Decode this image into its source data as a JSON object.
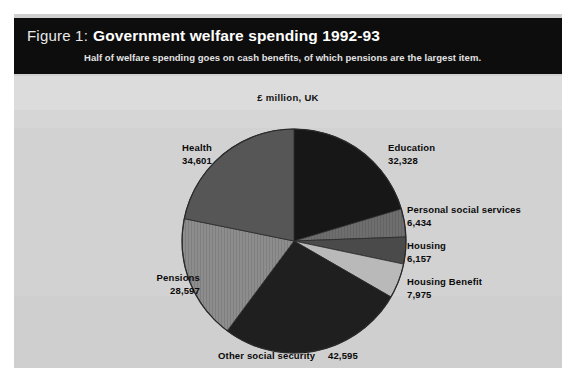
{
  "figure": {
    "number": "Figure 1:",
    "title": "Government welfare spending 1992-93",
    "subtitle": "Half of welfare spending goes on cash benefits, of which pensions are the largest item.",
    "units": "£ million, UK"
  },
  "chart_data": {
    "type": "pie",
    "title": "Government welfare spending 1992-93",
    "subtitle": "Half of welfare spending goes on cash benefits, of which pensions are the largest item.",
    "units": "£ million, UK",
    "xlabel": "",
    "ylabel": "",
    "legend_position": "callout-labels",
    "grid": false,
    "total": 158687,
    "categories": [
      "Education",
      "Personal social services",
      "Housing",
      "Housing Benefit",
      "Other social security",
      "Pensions",
      "Health"
    ],
    "values": [
      32328,
      6434,
      6157,
      7975,
      42595,
      28597,
      34601
    ],
    "value_labels": [
      "32,328",
      "6,434",
      "6,157",
      "7,975",
      "42,595",
      "28,597",
      "34,601"
    ],
    "colors": [
      "#171717",
      "#6e6e6e",
      "#4a4a4a",
      "#b9b9b9",
      "#1f1f1f",
      "#8d8d8d",
      "#565656"
    ],
    "slices": [
      {
        "label": "Education",
        "value": 32328,
        "value_text": "32,328",
        "color": "#171717",
        "start_angle": 0.0,
        "end_angle": 73.3
      },
      {
        "label": "Personal social services",
        "value": 6434,
        "value_text": "6,434",
        "color": "#6e6e6e",
        "start_angle": 73.3,
        "end_angle": 87.9
      },
      {
        "label": "Housing",
        "value": 6157,
        "value_text": "6,157",
        "color": "#4a4a4a",
        "start_angle": 87.9,
        "end_angle": 101.9
      },
      {
        "label": "Housing Benefit",
        "value": 7975,
        "value_text": "7,975",
        "color": "#b9b9b9",
        "start_angle": 101.9,
        "end_angle": 120.0
      },
      {
        "label": "Other social security",
        "value": 42595,
        "value_text": "42,595",
        "color": "#1f1f1f",
        "start_angle": 120.0,
        "end_angle": 216.6
      },
      {
        "label": "Pensions",
        "value": 28597,
        "value_text": "28,597",
        "color": "#8d8d8d",
        "start_angle": 216.6,
        "end_angle": 281.5
      },
      {
        "label": "Health",
        "value": 34601,
        "value_text": "34,601",
        "color": "#565656",
        "start_angle": 281.5,
        "end_angle": 360.0
      }
    ]
  },
  "labels": {
    "health": {
      "name": "Health",
      "value": "34,601"
    },
    "pensions": {
      "name": "Pensions",
      "value": "28,597"
    },
    "education": {
      "name": "Education",
      "value": "32,328"
    },
    "personal": {
      "name": "Personal social services",
      "value": "6,434"
    },
    "housing": {
      "name": "Housing",
      "value": "6,157"
    },
    "housing_benefit": {
      "name": "Housing Benefit",
      "value": "7,975"
    },
    "other": {
      "name": "Other social security",
      "value": "42,595"
    }
  }
}
